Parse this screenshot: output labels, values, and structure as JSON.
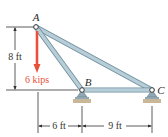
{
  "figure": {
    "type": "truss-diagram",
    "joints": [
      {
        "id": "A",
        "label": "A"
      },
      {
        "id": "B",
        "label": "B"
      },
      {
        "id": "C",
        "label": "C"
      }
    ],
    "members": [
      {
        "id": "AB",
        "from": "A",
        "to": "B"
      },
      {
        "id": "AC",
        "from": "A",
        "to": "C"
      },
      {
        "id": "BC",
        "from": "B",
        "to": "C"
      }
    ],
    "supports": [
      {
        "joint": "B",
        "type": "pin"
      },
      {
        "joint": "C",
        "type": "pin"
      }
    ],
    "load": {
      "joint": "A",
      "direction": "down",
      "magnitude_label": "6 kips",
      "color": "#e8503a"
    },
    "dimensions": {
      "vertical": {
        "label": "8 ft",
        "value_ft": 8
      },
      "horizontal": [
        {
          "label": "6 ft",
          "value_ft": 6
        },
        {
          "label": "9 ft",
          "value_ft": 9
        }
      ]
    },
    "colors": {
      "member_fill": "#a9c3cf",
      "member_edge": "#6f8f9c",
      "ground": "#c9b79a",
      "line": "#333333"
    }
  }
}
